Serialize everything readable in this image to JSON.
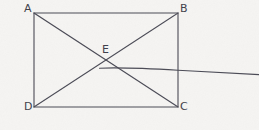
{
  "figure": {
    "kind": "geometry-diagram",
    "background_color": "#f5f4f2",
    "stroke_color": "#4a4a55",
    "label_color": "#3f3f4a",
    "stroke_width": 1.1,
    "width": 259,
    "height": 130
  },
  "labels": [
    {
      "id": "A",
      "text": "A",
      "x": 24,
      "y": 3
    },
    {
      "id": "B",
      "text": "B",
      "x": 180,
      "y": 3
    },
    {
      "id": "E",
      "text": "E",
      "x": 102,
      "y": 44
    },
    {
      "id": "D",
      "text": "D",
      "x": 24,
      "y": 101
    },
    {
      "id": "C",
      "text": "C",
      "x": 180,
      "y": 101
    }
  ],
  "points": {
    "A": {
      "x": 34,
      "y": 13
    },
    "B": {
      "x": 178,
      "y": 13
    },
    "C": {
      "x": 178,
      "y": 107
    },
    "D": {
      "x": 34,
      "y": 107
    },
    "E": {
      "x": 106,
      "y": 60
    }
  },
  "segments": [
    {
      "name": "side-AB",
      "from": "A",
      "to": "B"
    },
    {
      "name": "side-BC",
      "from": "B",
      "to": "C"
    },
    {
      "name": "side-CD",
      "from": "C",
      "to": "D"
    },
    {
      "name": "side-DA",
      "from": "D",
      "to": "A"
    },
    {
      "name": "diagonal-AC",
      "from": "A",
      "to": "C"
    },
    {
      "name": "diagonal-BD",
      "from": "B",
      "to": "D"
    }
  ],
  "paths": {
    "rectangle": "M 34 13 L 178 13 L 178 107 L 34 107 Z",
    "diagonal_ac": "M 34 13 L 178 107",
    "diagonal_bd": "M 178 13 L 34 107",
    "curve": "M 99.5 68.2 C 120 67.4 150 68.6 178 70.2 C 206 71.8 235 73.4 259 74.6"
  },
  "curve": {
    "name": "shallow-curve",
    "start": {
      "x": 99.5,
      "y": 68.2
    },
    "end": {
      "x": 259,
      "y": 74.6
    },
    "crosses_right_side_at": {
      "x": 178,
      "y": 70.2
    }
  }
}
